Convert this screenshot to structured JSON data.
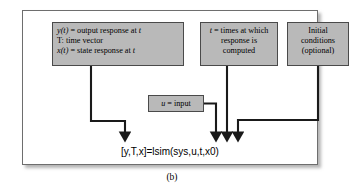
{
  "figure": {
    "caption": "(b)",
    "function_call": "[y,T,x]=lsim(sys,u,t,x0)"
  },
  "boxes": {
    "output_response": {
      "name": "output-and-state-response",
      "line1_a": "y(t)",
      "line1_b": " = output response at ",
      "line1_c": "t",
      "line2": "T: time vector",
      "line3_a": "x(t)",
      "line3_b": " = state response at ",
      "line3_c": "t"
    },
    "times": {
      "name": "times-at-which-response-computed",
      "line1_a": "t",
      "line1_b": " = times at which",
      "line2": "response is",
      "line3": "computed"
    },
    "initial_conditions": {
      "name": "initial-conditions",
      "line1": "Initial",
      "line2": "conditions",
      "line3": "(optional)"
    },
    "input": {
      "name": "input",
      "label_a": "u",
      "label_b": " = input"
    }
  },
  "style": {
    "box_fill": "#b9b9b9",
    "box_border": "#4a4a4a",
    "frame_border": "#6e6e6e",
    "wire_color": "#1a1a1a",
    "page_bg": "#ffffff"
  },
  "wires": [
    {
      "name": "output-response-to-call",
      "from": "output_response",
      "to": "function_call"
    },
    {
      "name": "times-to-call",
      "from": "times",
      "to": "function_call"
    },
    {
      "name": "initial-conditions-to-call",
      "from": "initial_conditions",
      "to": "function_call"
    },
    {
      "name": "input-to-call",
      "from": "input",
      "to": "function_call"
    }
  ]
}
